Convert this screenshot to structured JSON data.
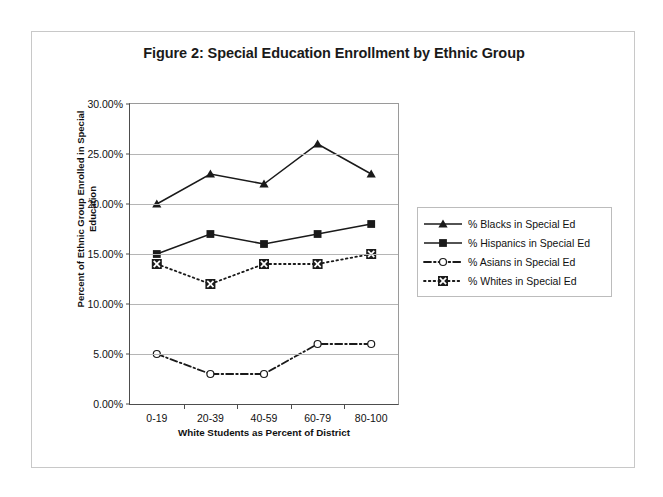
{
  "figure": {
    "title": "Figure 2: Special Education Enrollment by Ethnic Group"
  },
  "axes": {
    "y_title_line1": "Percent of Ethnic Group Enrolled in Special",
    "y_title_line2": "Education",
    "x_title": "White Students as Percent of District",
    "y_ticks": [
      "0.00%",
      "5.00%",
      "10.00%",
      "15.00%",
      "20.00%",
      "25.00%",
      "30.00%"
    ],
    "x_ticks": [
      "0-19",
      "20-39",
      "40-59",
      "60-79",
      "80-100"
    ]
  },
  "legend": {
    "position": "right",
    "items": [
      {
        "label": "% Blacks in Special Ed",
        "marker": "triangle",
        "line": "solid"
      },
      {
        "label": "% Hispanics in Special Ed",
        "marker": "square",
        "line": "solid"
      },
      {
        "label": "% Asians in Special Ed",
        "marker": "circle-open",
        "line": "dash-dot"
      },
      {
        "label": "% Whites in Special Ed",
        "marker": "x-square",
        "line": "dotted"
      }
    ]
  },
  "chart_data": {
    "type": "line",
    "title": "Figure 2: Special Education Enrollment by Ethnic Group",
    "xlabel": "White Students as Percent of District",
    "ylabel": "Percent of Ethnic Group Enrolled in Special Education",
    "categories": [
      "0-19",
      "20-39",
      "40-59",
      "60-79",
      "80-100"
    ],
    "ylim": [
      0,
      30
    ],
    "ytick_step": 5,
    "yunit": "percent",
    "grid": true,
    "legend_position": "right",
    "series": [
      {
        "name": "% Blacks in Special Ed",
        "marker": "triangle",
        "line": "solid",
        "values": [
          20,
          23,
          22,
          26,
          23
        ]
      },
      {
        "name": "% Hispanics in Special Ed",
        "marker": "square",
        "line": "solid",
        "values": [
          15,
          17,
          16,
          17,
          18
        ]
      },
      {
        "name": "% Asians in Special Ed",
        "marker": "circle-open",
        "line": "dash-dot",
        "values": [
          5,
          3,
          3,
          6,
          6
        ]
      },
      {
        "name": "% Whites in Special Ed",
        "marker": "x-square",
        "line": "dotted",
        "values": [
          14,
          12,
          14,
          14,
          15
        ]
      }
    ]
  },
  "colors": {
    "series_ink": "#1a1a1a",
    "grid": "#b5b5b5",
    "axis": "#4d4d4d",
    "frame": "#c8c8c8",
    "page": "#ffffff",
    "canvas": "#f2f2f2"
  }
}
